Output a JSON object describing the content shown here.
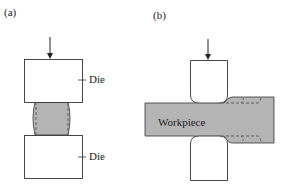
{
  "panel_a": {
    "label": "(a)",
    "upper_die_label": "Die",
    "lower_die_label": "Die"
  },
  "panel_b": {
    "label": "(b)",
    "workpiece_label": "Workpiece"
  },
  "colors": {
    "workpiece_fill": "#b4b4b4",
    "outline": "#333333",
    "background": "#ffffff"
  }
}
